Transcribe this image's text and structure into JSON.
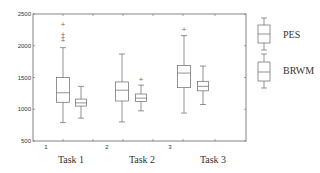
{
  "chart_data": {
    "type": "boxplot",
    "title": "",
    "xlabel": "",
    "ylabel": "",
    "ylim": [
      500,
      2500
    ],
    "yticks": [
      500,
      1000,
      1500,
      2000,
      2500
    ],
    "ytick_labels": [
      "500",
      "1000",
      "1500",
      "2000",
      "2500"
    ],
    "xtick_numbers": [
      "1",
      "2",
      "3"
    ],
    "categories": [
      "Task 1",
      "Task 2",
      "Task 3"
    ],
    "grid": false,
    "legend": {
      "placement": "right-outside",
      "entries": [
        "PES",
        "BRWM"
      ]
    },
    "series": [
      {
        "name": "PES",
        "boxes": [
          {
            "category": "Task 1",
            "whisker_low": 790,
            "q1": 1110,
            "median": 1260,
            "q3": 1500,
            "whisker_high": 1970,
            "outliers": [
              2090,
              2140,
              2180,
              2350
            ]
          },
          {
            "category": "Task 2",
            "whisker_low": 800,
            "q1": 1130,
            "median": 1300,
            "q3": 1430,
            "whisker_high": 1870,
            "outliers": []
          },
          {
            "category": "Task 3",
            "whisker_low": 940,
            "q1": 1340,
            "median": 1570,
            "q3": 1690,
            "whisker_high": 2160,
            "outliers": [
              2260
            ]
          }
        ]
      },
      {
        "name": "BRWM",
        "boxes": [
          {
            "category": "Task 1",
            "whisker_low": 860,
            "q1": 1050,
            "median": 1100,
            "q3": 1160,
            "whisker_high": 1360,
            "outliers": []
          },
          {
            "category": "Task 2",
            "whisker_low": 975,
            "q1": 1120,
            "median": 1175,
            "q3": 1240,
            "whisker_high": 1380,
            "outliers": [
              1470
            ]
          },
          {
            "category": "Task 3",
            "whisker_low": 1075,
            "q1": 1290,
            "median": 1360,
            "q3": 1440,
            "whisker_high": 1680,
            "outliers": []
          }
        ]
      }
    ]
  }
}
